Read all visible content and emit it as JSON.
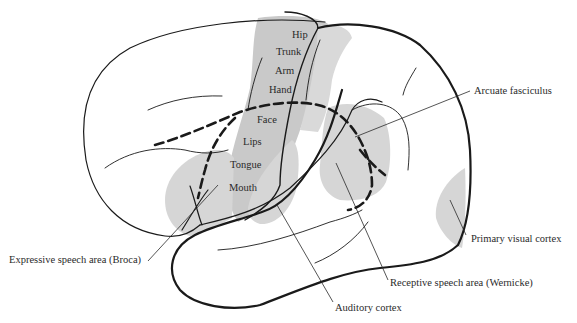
{
  "figure": {
    "colors": {
      "background": "#ffffff",
      "outline": "#1a1a1a",
      "shaded_region": "#d6d6d6",
      "motor_strip": "#c9c9c9",
      "text": "#2a2a2a"
    },
    "motor_homunculus_labels": [
      "Hip",
      "Trunk",
      "Arm",
      "Hand",
      "Face",
      "Lips",
      "Tongue",
      "Mouth"
    ],
    "callouts": {
      "arcuate": "Arcuate fasciculus",
      "broca": "Expressive speech area (Broca)",
      "visual": "Primary visual cortex",
      "wernicke": "Receptive speech area (Wernicke)",
      "auditory": "Auditory cortex"
    }
  }
}
